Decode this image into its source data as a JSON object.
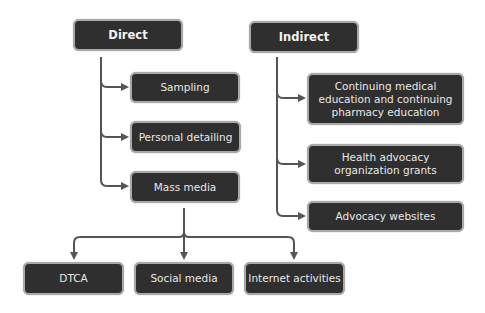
{
  "diagram": {
    "colors": {
      "box_fill": "#2f2f2f",
      "box_border": "#a8a8a8",
      "text": "#e8e8e8",
      "connector": "#555555",
      "background": "#ffffff"
    },
    "direct": {
      "label": "Direct",
      "children": [
        {
          "label": "Sampling"
        },
        {
          "label": "Personal detailing"
        },
        {
          "label": "Mass media"
        }
      ]
    },
    "mass_media_children": [
      {
        "label": "DTCA"
      },
      {
        "label": "Social media"
      },
      {
        "label": "Internet activities"
      }
    ],
    "indirect": {
      "label": "Indirect",
      "children": [
        {
          "label": "Continuing medical education and continuing pharmacy education"
        },
        {
          "label": "Health advocacy organization grants"
        },
        {
          "label": "Advocacy websites"
        }
      ]
    }
  }
}
